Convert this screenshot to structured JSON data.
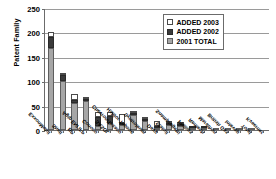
{
  "chart_data": {
    "type": "bar",
    "subtype": "stacked-bar",
    "title": "",
    "xlabel": "",
    "ylabel": "Patent Family",
    "ylim": [
      0,
      250
    ],
    "yticks": [
      0,
      50,
      100,
      150,
      200,
      250
    ],
    "grid": true,
    "legend_position": "top-right",
    "categories": [
      "ExxonMobil",
      "Shell",
      "BP",
      "Agip ENI IFP",
      "Conoco",
      "SASOL",
      "Chevron/Texaco",
      "Haldor Topsoe",
      "Syntroleum",
      "Davy",
      "Statoil",
      "Snamprogetti",
      "Phillips",
      "Rentech",
      "Marathon",
      "British Gas",
      "Intevep",
      "Total",
      "Kvaerner"
    ],
    "series": [
      {
        "name": "2001 TOTAL",
        "color": "#a6a6a6",
        "values": [
          168,
          100,
          56,
          59,
          8,
          14,
          11,
          30,
          18,
          2,
          10,
          9,
          5,
          1,
          2,
          1,
          1,
          1,
          0
        ]
      },
      {
        "name": "ADDED 2002",
        "color": "#3b3b3b",
        "values": [
          23,
          12,
          5,
          4,
          18,
          14,
          4,
          1,
          3,
          1,
          3,
          2,
          1,
          1,
          0,
          0,
          0,
          0,
          0
        ]
      },
      {
        "name": "ADDED 2003",
        "color": "#ffffff",
        "values": [
          10,
          5,
          12,
          3,
          10,
          8,
          17,
          1,
          1,
          11,
          1,
          1,
          0,
          0,
          0,
          0,
          0,
          0,
          0
        ]
      }
    ],
    "totals": [
      201,
      117,
      73,
      66,
      36,
      36,
      32,
      32,
      22,
      14,
      14,
      12,
      6,
      2,
      2,
      1,
      1,
      1,
      0
    ]
  },
  "legend": {
    "entries": [
      {
        "label": "ADDED 2003",
        "swatch": "white-square-icon"
      },
      {
        "label": "ADDED 2002",
        "swatch": "black-square-icon"
      },
      {
        "label": "2001 TOTAL",
        "swatch": "gray-square-icon"
      }
    ]
  }
}
